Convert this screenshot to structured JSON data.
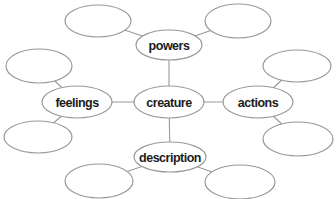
{
  "diagram": {
    "type": "concept-map",
    "background_color": "#ffffff",
    "node_fill_color": "#ffffff",
    "stroke_color": "#999999",
    "text_color": "#1c1c1c",
    "canvas": {
      "width": 336,
      "height": 199
    },
    "center_node": "creature",
    "nodes": [
      {
        "id": "creature",
        "label": "creature",
        "cx": 169,
        "cy": 102,
        "rx": 35,
        "ry": 16
      },
      {
        "id": "powers",
        "label": "powers",
        "cx": 169,
        "cy": 45,
        "rx": 33,
        "ry": 15
      },
      {
        "id": "feelings",
        "label": "feelings",
        "cx": 77,
        "cy": 102,
        "rx": 35,
        "ry": 16
      },
      {
        "id": "actions",
        "label": "actions",
        "cx": 258,
        "cy": 102,
        "rx": 35,
        "ry": 16
      },
      {
        "id": "description",
        "label": "description",
        "cx": 170,
        "cy": 157,
        "rx": 36,
        "ry": 15
      },
      {
        "id": "blank-top-left",
        "label": "",
        "cx": 98,
        "cy": 21,
        "rx": 33,
        "ry": 16
      },
      {
        "id": "blank-top-right",
        "label": "",
        "cx": 238,
        "cy": 21,
        "rx": 33,
        "ry": 17
      },
      {
        "id": "blank-left-upper",
        "label": "",
        "cx": 39,
        "cy": 66,
        "rx": 33,
        "ry": 17
      },
      {
        "id": "blank-left-lower",
        "label": "",
        "cx": 38,
        "cy": 137,
        "rx": 34,
        "ry": 16
      },
      {
        "id": "blank-right-upper",
        "label": "",
        "cx": 297,
        "cy": 66,
        "rx": 34,
        "ry": 16
      },
      {
        "id": "blank-right-lower",
        "label": "",
        "cx": 298,
        "cy": 139,
        "rx": 35,
        "ry": 17
      },
      {
        "id": "blank-bottom-left",
        "label": "",
        "cx": 99,
        "cy": 181,
        "rx": 34,
        "ry": 17
      },
      {
        "id": "blank-bottom-right",
        "label": "",
        "cx": 240,
        "cy": 182,
        "rx": 35,
        "ry": 17
      }
    ],
    "edges": [
      {
        "from": "creature",
        "to": "powers"
      },
      {
        "from": "creature",
        "to": "feelings"
      },
      {
        "from": "creature",
        "to": "actions"
      },
      {
        "from": "creature",
        "to": "description"
      },
      {
        "from": "powers",
        "to": "blank-top-left"
      },
      {
        "from": "powers",
        "to": "blank-top-right"
      },
      {
        "from": "feelings",
        "to": "blank-left-upper"
      },
      {
        "from": "feelings",
        "to": "blank-left-lower"
      },
      {
        "from": "actions",
        "to": "blank-right-upper"
      },
      {
        "from": "actions",
        "to": "blank-right-lower"
      },
      {
        "from": "description",
        "to": "blank-bottom-left"
      },
      {
        "from": "description",
        "to": "blank-bottom-right"
      }
    ]
  }
}
